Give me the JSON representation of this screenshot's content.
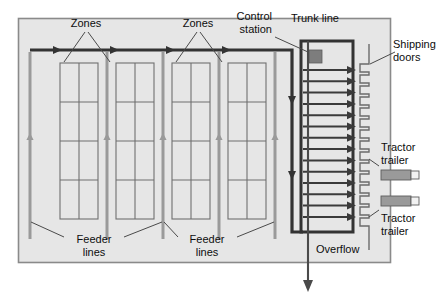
{
  "diagram": {
    "type": "warehouse-conveyor-schematic",
    "colors": {
      "floor_fill": "#e6e6e6",
      "floor_border": "#7a7a7a",
      "trunk_line": "#333333",
      "feeder_line": "#8e8e8e",
      "rack_line": "#6f6f6f",
      "rack_fill": "#e6e6e6",
      "control_station_fill": "#7d7d7d",
      "trailer_body_fill": "#9a9a9a",
      "trailer_cab_fill": "#f2f2f2",
      "leader_line": "#4a4a4a",
      "text": "#0d0d0d"
    },
    "labels": {
      "zones_left": "Zones",
      "zones_right": "Zones",
      "control_station": "Control\nstation",
      "control_station_line1": "Control",
      "control_station_line2": "station",
      "trunk_line": "Trunk line",
      "shipping_doors_line1": "Shipping",
      "shipping_doors_line2": "doors",
      "tractor_trailer_top_line1": "Tractor",
      "tractor_trailer_top_line2": "trailer",
      "tractor_trailer_bottom_line1": "Tractor",
      "tractor_trailer_bottom_line2": "trailer",
      "feeder_lines_left_line1": "Feeder",
      "feeder_lines_left_line2": "lines",
      "feeder_lines_right_line1": "Feeder",
      "feeder_lines_right_line2": "lines",
      "overflow": "Overflow"
    },
    "counts": {
      "racks": 4,
      "feeder_lines": 5,
      "rack_rows": 4,
      "rack_columns": 2,
      "shipping_lanes": 14,
      "shipping_doors": 14,
      "tractor_trailers": 2,
      "control_stations": 1
    },
    "racks": [
      {
        "id": "rack-1",
        "x": 60,
        "y": 63,
        "w": 38,
        "h": 156
      },
      {
        "id": "rack-2",
        "x": 116,
        "y": 63,
        "w": 38,
        "h": 156
      },
      {
        "id": "rack-3",
        "x": 172,
        "y": 63,
        "w": 38,
        "h": 156
      },
      {
        "id": "rack-4",
        "x": 228,
        "y": 63,
        "w": 38,
        "h": 156
      }
    ],
    "feeder_lines": [
      {
        "id": "feeder-1",
        "x": 30
      },
      {
        "id": "feeder-2",
        "x": 107
      },
      {
        "id": "feeder-3",
        "x": 163
      },
      {
        "id": "feeder-4",
        "x": 219
      },
      {
        "id": "feeder-5",
        "x": 275
      }
    ],
    "trunk_path": {
      "description": "Thick dark line: enters top-left, runs right across zones, turns down at control station, runs down, then right into the trunk line box bottom",
      "top_y": 50,
      "left_x": 30,
      "turn_x": 295,
      "bottom_y": 232
    },
    "overflow": {
      "x": 308,
      "from_y": 232,
      "to_y": 290,
      "label": "Overflow"
    }
  }
}
